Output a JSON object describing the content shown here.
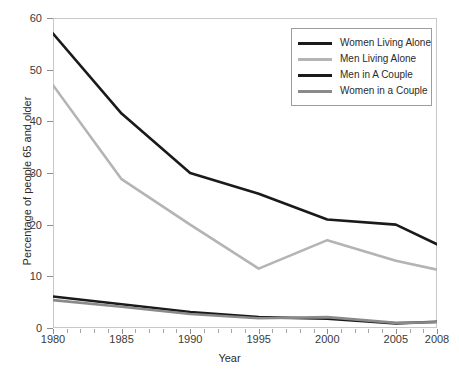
{
  "chart_data": {
    "type": "line",
    "title": "",
    "xlabel": "Year",
    "ylabel": "Percentage of people 65 and older",
    "x": [
      1980,
      1985,
      1990,
      1995,
      2000,
      2005,
      2008
    ],
    "xlim": [
      1980,
      2008
    ],
    "ylim": [
      0,
      60
    ],
    "xticks": [
      1980,
      1985,
      1990,
      1995,
      2000,
      2005,
      2008
    ],
    "xtick_labels": [
      "1980",
      "1985",
      "1990",
      "1995",
      "2000",
      "2005",
      "2008"
    ],
    "yticks": [
      0,
      10,
      20,
      30,
      40,
      50,
      60
    ],
    "ytick_labels": [
      "0",
      "10",
      "20",
      "30",
      "40",
      "50",
      "60"
    ],
    "grid": false,
    "legend_position": "top-right",
    "series": [
      {
        "name": "Women Living Alone",
        "color": "#1a1a1a",
        "values": [
          57,
          41.5,
          30,
          26,
          21,
          20,
          16.2
        ]
      },
      {
        "name": "Men Living Alone",
        "color": "#b4b4b4",
        "values": [
          47,
          28.8,
          20,
          11.5,
          17,
          13,
          11.3
        ]
      },
      {
        "name": "Men in A Couple",
        "color": "#1a1a1a",
        "values": [
          6.1,
          4.6,
          3.1,
          2.1,
          1.8,
          0.9,
          1.2
        ]
      },
      {
        "name": "Women in a Couple",
        "color": "#8a8a8a",
        "values": [
          5.4,
          4.1,
          2.7,
          1.9,
          2.1,
          1.0,
          1.1
        ]
      }
    ]
  }
}
